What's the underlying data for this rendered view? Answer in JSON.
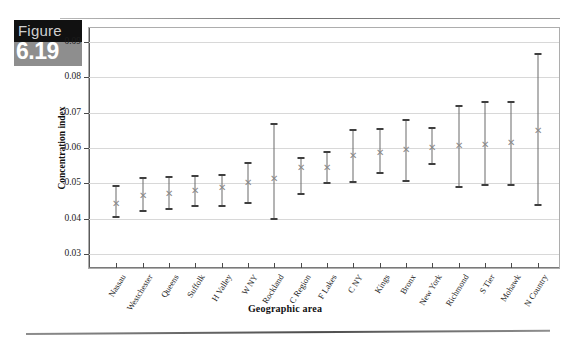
{
  "figure": {
    "word": "Figure",
    "number": "6.19"
  },
  "chart_data": {
    "type": "scatter",
    "title": "",
    "xlabel": "Geographic area",
    "ylabel": "Concentration index",
    "ylim": [
      0.03,
      0.09
    ],
    "yticks": [
      "0.03",
      "0.04",
      "0.05",
      "0.06",
      "0.07",
      "0.08",
      "0.09"
    ],
    "grid": true,
    "legend": "none",
    "marker": "x",
    "error_bars": "vertical range with caps",
    "categories": [
      "Nassau",
      "Westchester",
      "Queens",
      "Suffolk",
      "H Valley",
      "W NY",
      "Rockland",
      "C Region",
      "F Lakes",
      "C NY",
      "Kings",
      "Bronx",
      "New York",
      "Richmond",
      "S Tier",
      "Mohawk",
      "N Country"
    ],
    "values": [
      0.0445,
      0.0468,
      0.0472,
      0.048,
      0.049,
      0.0503,
      0.0515,
      0.0545,
      0.0545,
      0.058,
      0.059,
      0.0597,
      0.0602,
      0.0608,
      0.0612,
      0.0617,
      0.0652
    ],
    "lower": [
      0.0405,
      0.0423,
      0.0428,
      0.0437,
      0.0435,
      0.0443,
      0.04,
      0.047,
      0.05,
      0.0505,
      0.0528,
      0.0508,
      0.0555,
      0.049,
      0.0495,
      0.0495,
      0.044
    ],
    "upper": [
      0.0492,
      0.0515,
      0.0518,
      0.0522,
      0.0525,
      0.0557,
      0.0667,
      0.0573,
      0.059,
      0.065,
      0.0653,
      0.068,
      0.0657,
      0.072,
      0.073,
      0.073,
      0.0865
    ],
    "series": [
      {
        "name": "Concentration index",
        "points": [
          {
            "category": "Nassau",
            "value": 0.0445,
            "lower": 0.0405,
            "upper": 0.0492
          },
          {
            "category": "Westchester",
            "value": 0.0468,
            "lower": 0.0423,
            "upper": 0.0515
          },
          {
            "category": "Queens",
            "value": 0.0472,
            "lower": 0.0428,
            "upper": 0.0518
          },
          {
            "category": "Suffolk",
            "value": 0.048,
            "lower": 0.0437,
            "upper": 0.0522
          },
          {
            "category": "H Valley",
            "value": 0.049,
            "lower": 0.0435,
            "upper": 0.0525
          },
          {
            "category": "W NY",
            "value": 0.0503,
            "lower": 0.0443,
            "upper": 0.0557
          },
          {
            "category": "Rockland",
            "value": 0.0515,
            "lower": 0.04,
            "upper": 0.0667
          },
          {
            "category": "C Region",
            "value": 0.0545,
            "lower": 0.047,
            "upper": 0.0573
          },
          {
            "category": "F Lakes",
            "value": 0.0545,
            "lower": 0.05,
            "upper": 0.059
          },
          {
            "category": "C NY",
            "value": 0.058,
            "lower": 0.0505,
            "upper": 0.065
          },
          {
            "category": "Kings",
            "value": 0.059,
            "lower": 0.0528,
            "upper": 0.0653
          },
          {
            "category": "Bronx",
            "value": 0.0597,
            "lower": 0.0508,
            "upper": 0.068
          },
          {
            "category": "New York",
            "value": 0.0602,
            "lower": 0.0555,
            "upper": 0.0657
          },
          {
            "category": "Richmond",
            "value": 0.0608,
            "lower": 0.049,
            "upper": 0.072
          },
          {
            "category": "S Tier",
            "value": 0.0612,
            "lower": 0.0495,
            "upper": 0.073
          },
          {
            "category": "Mohawk",
            "value": 0.0617,
            "lower": 0.0495,
            "upper": 0.073
          },
          {
            "category": "N Country",
            "value": 0.0652,
            "lower": 0.044,
            "upper": 0.0865
          }
        ]
      }
    ]
  },
  "colors": {
    "grid": "#d8d8d8",
    "axis": "#5a5a5a",
    "errorbar": "#6b6b6b",
    "marker": "#8a8a8a",
    "badge_dark": "#111111",
    "badge_gray": "#8e8e8e"
  }
}
